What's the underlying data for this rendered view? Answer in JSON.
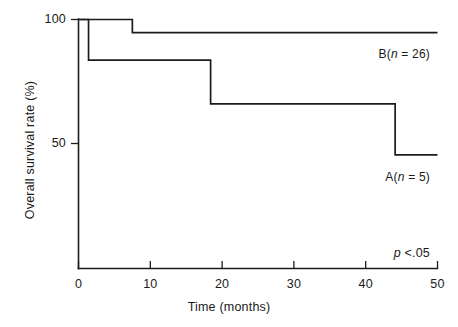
{
  "chart_data": {
    "type": "line",
    "subtype": "kaplan-meier-step",
    "title": "",
    "xlabel": "Time (months)",
    "ylabel": "Overall survival rate (%)",
    "xlim": [
      0,
      50
    ],
    "ylim": [
      0,
      100
    ],
    "xticks": [
      0,
      10,
      20,
      30,
      40,
      50
    ],
    "xticklabels": [
      "0",
      "10",
      "20",
      "30",
      "40",
      "50"
    ],
    "yticks": [
      50,
      100
    ],
    "yticklabels": [
      "50",
      "100"
    ],
    "grid": false,
    "legend_position": "inline-right",
    "series": [
      {
        "name": "B",
        "label": "B(n = 26)",
        "n": 26,
        "label_prefix": "B(",
        "label_italic": "n",
        "label_suffix": " = 26)",
        "color": "#1c1c1c",
        "steps": [
          {
            "x": 0,
            "y": 100
          },
          {
            "x": 7.5,
            "y": 100
          },
          {
            "x": 7.5,
            "y": 94.7
          },
          {
            "x": 50,
            "y": 94.7
          }
        ]
      },
      {
        "name": "A",
        "label": "A(n = 5)",
        "n": 5,
        "label_prefix": "A(",
        "label_italic": "n",
        "label_suffix": " = 5)",
        "color": "#1c1c1c",
        "steps": [
          {
            "x": 0,
            "y": 100
          },
          {
            "x": 1.4,
            "y": 100
          },
          {
            "x": 1.4,
            "y": 83.6
          },
          {
            "x": 18.4,
            "y": 83.6
          },
          {
            "x": 18.4,
            "y": 66.0
          },
          {
            "x": 44.1,
            "y": 66.0
          },
          {
            "x": 44.1,
            "y": 45.4
          },
          {
            "x": 50,
            "y": 45.4
          }
        ]
      }
    ],
    "annotations": [
      {
        "name": "p-value",
        "text": "p <.05",
        "italic_part": "p",
        "rest": " <.05"
      }
    ]
  },
  "axes": {
    "x_title": "Time (months)",
    "y_title": "Overall survival rate (%)"
  }
}
